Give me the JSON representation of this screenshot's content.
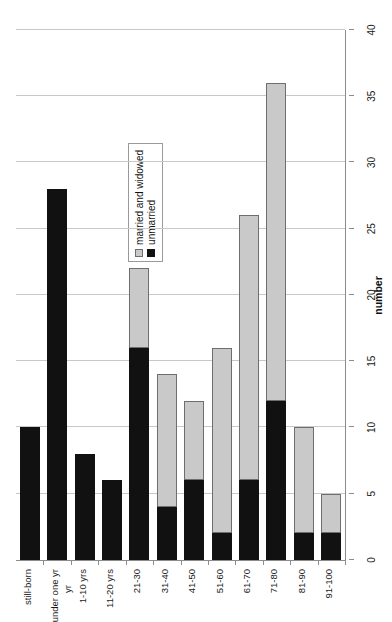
{
  "chart_data": {
    "type": "bar",
    "orientation": "horizontal",
    "stacked": true,
    "title": "",
    "xlabel": "number",
    "ylabel": "yr",
    "xlim": [
      0,
      40
    ],
    "xticks": [
      0,
      5,
      10,
      15,
      20,
      25,
      30,
      35,
      40
    ],
    "grid": true,
    "legend_position": "plot-left-upper",
    "categories": [
      "still-born",
      "under one yr",
      "1-10 yrs",
      "11-20 yrs",
      "21-30",
      "31-40",
      "41-50",
      "51-60",
      "61-70",
      "71-80",
      "81-90",
      "91-100"
    ],
    "series": [
      {
        "name": "unmarried",
        "color": "#111111",
        "values": [
          10,
          28,
          8,
          6,
          16,
          4,
          6,
          2,
          6,
          12,
          2,
          2
        ]
      },
      {
        "name": "married and widowed",
        "color": "#c9c9c9",
        "values": [
          0,
          0,
          0,
          0,
          6,
          10,
          6,
          14,
          20,
          24,
          8,
          3
        ]
      }
    ],
    "totals": [
      10,
      28,
      8,
      6,
      22,
      14,
      12,
      16,
      26,
      36,
      10,
      5
    ]
  },
  "axes": {
    "value_axis_title": "number",
    "category_axis_title": "yr",
    "tick_labels": [
      "0",
      "5",
      "10",
      "15",
      "20",
      "25",
      "30",
      "35",
      "40"
    ]
  },
  "legend": {
    "items": [
      {
        "label": "married and widowed",
        "color": "#c9c9c9"
      },
      {
        "label": "unmarried",
        "color": "#111111"
      }
    ]
  }
}
